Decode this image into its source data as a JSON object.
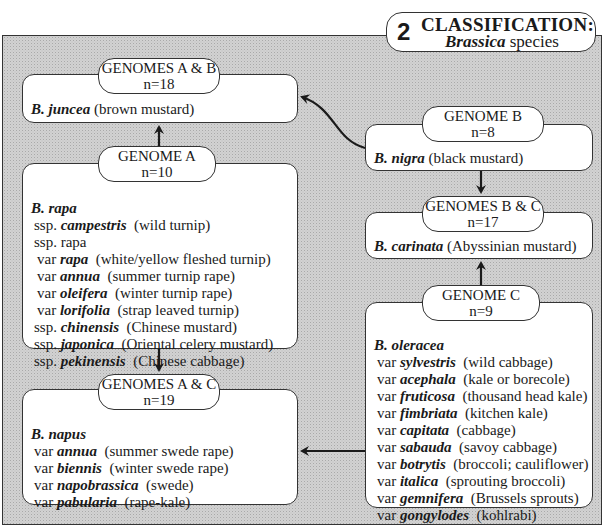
{
  "title": {
    "number": "2",
    "heading": "CLASSIFICATION:",
    "subtitle_genus": "Brassica",
    "subtitle_rest": " species"
  },
  "nodes": {
    "ab": {
      "genome": "GENOMES A & B",
      "chromosomes": "n=18",
      "species": "B. juncea",
      "common": " (brown mustard)",
      "lines": []
    },
    "a": {
      "genome": "GENOME A",
      "chromosomes": "n=10",
      "species": "B. rapa",
      "common": "",
      "lines": [
        {
          "prefix": "ssp. ",
          "name": "campestris",
          "desc": "  (wild turnip)",
          "indent": 1
        },
        {
          "prefix": "ssp. rapa",
          "name": "",
          "desc": "",
          "indent": 1
        },
        {
          "prefix": "var ",
          "name": "rapa",
          "desc": "  (white/yellow fleshed turnip)",
          "indent": 2
        },
        {
          "prefix": "var ",
          "name": "annua",
          "desc": "  (summer turnip rape)",
          "indent": 2
        },
        {
          "prefix": "var ",
          "name": "oleifera",
          "desc": "  (winter turnip rape)",
          "indent": 2
        },
        {
          "prefix": "var ",
          "name": "lorifolia",
          "desc": "  (strap leaved turnip)",
          "indent": 2
        },
        {
          "prefix": "ssp. ",
          "name": "chinensis",
          "desc": "  (Chinese mustard)",
          "indent": 1
        },
        {
          "prefix": "ssp. ",
          "name": "japonica",
          "desc": "  (Oriental celery mustard)",
          "indent": 1
        },
        {
          "prefix": "ssp. ",
          "name": "pekinensis",
          "desc": "  (Chinese cabbage)",
          "indent": 1
        }
      ]
    },
    "ac": {
      "genome": "GENOMES A & C",
      "chromosomes": "n=19",
      "species": "B. napus",
      "common": "",
      "lines": [
        {
          "prefix": "var ",
          "name": "annua",
          "desc": "  (summer swede rape)",
          "indent": 1
        },
        {
          "prefix": "var ",
          "name": "biennis",
          "desc": "  (winter swede rape)",
          "indent": 1
        },
        {
          "prefix": "var ",
          "name": "napobrassica",
          "desc": "  (swede)",
          "indent": 1
        },
        {
          "prefix": "var ",
          "name": "pabularia",
          "desc": "  (rape-kale)",
          "indent": 1
        }
      ]
    },
    "b": {
      "genome": "GENOME B",
      "chromosomes": "n=8",
      "species": "B. nigra",
      "common": " (black mustard)",
      "lines": []
    },
    "bc": {
      "genome": "GENOMES B & C",
      "chromosomes": "n=17",
      "species": "B. carinata",
      "common": " (Abyssinian mustard)",
      "lines": []
    },
    "c": {
      "genome": "GENOME C",
      "chromosomes": "n=9",
      "species": "B. oleracea",
      "common": "",
      "lines": [
        {
          "prefix": "var ",
          "name": "sylvestris",
          "desc": "  (wild cabbage)",
          "indent": 1
        },
        {
          "prefix": "var ",
          "name": "acephala",
          "desc": "  (kale or borecole)",
          "indent": 1
        },
        {
          "prefix": "var ",
          "name": "fruticosa",
          "desc": "  (thousand head kale)",
          "indent": 1
        },
        {
          "prefix": "var ",
          "name": "fimbriata",
          "desc": "  (kitchen kale)",
          "indent": 1
        },
        {
          "prefix": "var ",
          "name": "capitata",
          "desc": "  (cabbage)",
          "indent": 1
        },
        {
          "prefix": "var ",
          "name": "sabauda",
          "desc": "  (savoy cabbage)",
          "indent": 1
        },
        {
          "prefix": "var ",
          "name": "botrytis",
          "desc": "  (broccoli; cauliflower)",
          "indent": 1
        },
        {
          "prefix": "var ",
          "name": "italica",
          "desc": "  (sprouting broccoli)",
          "indent": 1
        },
        {
          "prefix": "var ",
          "name": "gemnifera",
          "desc": "  (Brussels sprouts)",
          "indent": 1
        },
        {
          "prefix": "var ",
          "name": "gongylodes",
          "desc": "  (kohlrabi)",
          "indent": 1
        }
      ]
    }
  },
  "edges": [
    {
      "from": "a",
      "to": "ab"
    },
    {
      "from": "b",
      "to": "ab"
    },
    {
      "from": "b",
      "to": "bc"
    },
    {
      "from": "c",
      "to": "bc"
    },
    {
      "from": "a",
      "to": "ac"
    },
    {
      "from": "c",
      "to": "ac"
    }
  ]
}
